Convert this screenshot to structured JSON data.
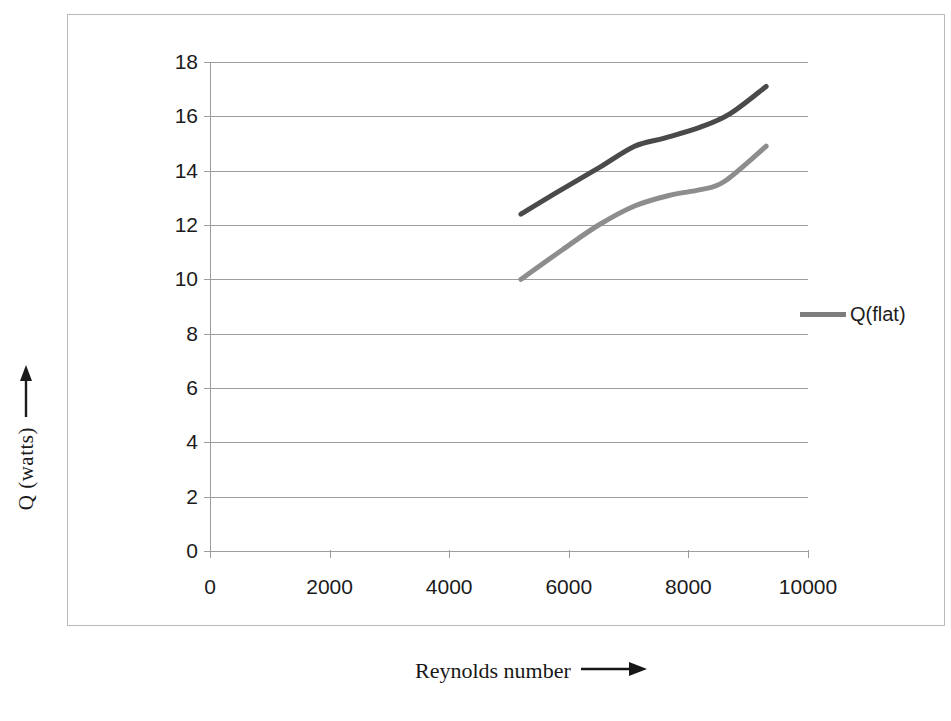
{
  "chart_data": {
    "type": "line",
    "title": "",
    "xlabel": "Reynolds number",
    "ylabel": "Q (watts)",
    "xlim": [
      0,
      10000
    ],
    "ylim": [
      0,
      18
    ],
    "xticks": [
      0,
      2000,
      4000,
      6000,
      8000,
      10000
    ],
    "yticks": [
      0,
      2,
      4,
      6,
      8,
      10,
      12,
      14,
      16,
      18
    ],
    "xtick_labels": [
      "0",
      "2000",
      "4000",
      "6000",
      "8000",
      "10000"
    ],
    "ytick_labels": [
      "0",
      "2",
      "4",
      "6",
      "8",
      "10",
      "12",
      "14",
      "16",
      "18"
    ],
    "grid": "horizontal",
    "legend_position": "right",
    "series": [
      {
        "name": "Q(dark)",
        "color": "#4a4a4a",
        "x": [
          5200,
          5800,
          6500,
          7100,
          7600,
          8200,
          8700,
          9300
        ],
        "y": [
          12.4,
          13.2,
          14.1,
          14.9,
          15.2,
          15.6,
          16.1,
          17.1
        ]
      },
      {
        "name": "Q(flat)",
        "color": "#8d8d8d",
        "x": [
          5200,
          5900,
          6500,
          7100,
          7700,
          8200,
          8600,
          9300
        ],
        "y": [
          10.0,
          11.1,
          12.0,
          12.7,
          13.1,
          13.3,
          13.6,
          14.9
        ]
      }
    ],
    "legend": [
      {
        "label": "Q(flat)",
        "color": "#7d7d7d"
      }
    ],
    "colors": {
      "dark_series": "#4a4a4a",
      "light_series": "#8d8d8d",
      "gridline": "#9d9d9d",
      "frame": "#b9b9b9",
      "text": "#1b1b1b"
    }
  },
  "axes": {
    "y_title": "Q (watts)",
    "x_title": "Reynolds number"
  },
  "legend": {
    "entry_label": "Q(flat)"
  }
}
